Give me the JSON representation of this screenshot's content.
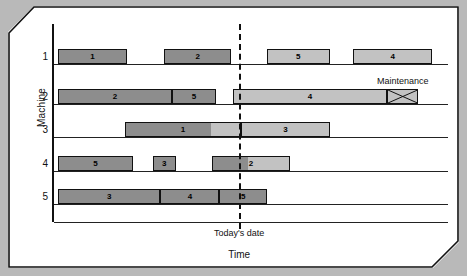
{
  "figure": {
    "background_color": "#b9b9b9",
    "sheet_color": "#ffffff"
  },
  "chart_data": {
    "type": "bar",
    "subtype": "gantt",
    "title": "",
    "xlabel": "Time",
    "ylabel": "Machine",
    "categories": [
      "1",
      "2",
      "3",
      "4",
      "5"
    ],
    "grid": false,
    "legend": "none",
    "colors": {
      "completed": "#8d8d8d",
      "remaining": "#c2c2c2",
      "outline": "#111111",
      "today_line": "#111111"
    },
    "annotations": [
      {
        "name": "today-line",
        "label": "Today's date",
        "x": 0.47
      },
      {
        "name": "maintenance-block",
        "label": "Maintenance",
        "machine": "2",
        "start": 0.845,
        "end": 0.925
      }
    ],
    "xlim": [
      0,
      1
    ],
    "axis_origin_x": 0.0,
    "series": [
      {
        "name": "Machine 1",
        "machine": "1",
        "tasks": [
          {
            "job": "1",
            "start": 0.01,
            "end": 0.185,
            "state": "completed"
          },
          {
            "job": "2",
            "start": 0.28,
            "end": 0.45,
            "state": "completed"
          },
          {
            "job": "5",
            "start": 0.54,
            "end": 0.7,
            "state": "remaining"
          },
          {
            "job": "4",
            "start": 0.76,
            "end": 0.96,
            "state": "remaining"
          }
        ]
      },
      {
        "name": "Machine 2",
        "machine": "2",
        "tasks": [
          {
            "job": "2",
            "start": 0.01,
            "end": 0.3,
            "state": "completed"
          },
          {
            "job": "5",
            "start": 0.3,
            "end": 0.41,
            "state": "completed"
          },
          {
            "job": "4",
            "start": 0.455,
            "end": 0.845,
            "state": "remaining"
          },
          {
            "job": "",
            "start": 0.845,
            "end": 0.925,
            "state": "maintenance"
          }
        ]
      },
      {
        "name": "Machine 3",
        "machine": "3",
        "tasks": [
          {
            "job": "1",
            "start": 0.18,
            "end": 0.475,
            "state": "in-progress",
            "progress": 0.73
          },
          {
            "job": "3",
            "start": 0.475,
            "end": 0.7,
            "state": "remaining"
          }
        ]
      },
      {
        "name": "Machine 4",
        "machine": "4",
        "tasks": [
          {
            "job": "5",
            "start": 0.01,
            "end": 0.2,
            "state": "completed"
          },
          {
            "job": "3",
            "start": 0.25,
            "end": 0.31,
            "state": "completed"
          },
          {
            "job": "2",
            "start": 0.4,
            "end": 0.6,
            "state": "in-progress",
            "progress": 0.45
          }
        ]
      },
      {
        "name": "Machine 5",
        "machine": "5",
        "tasks": [
          {
            "job": "3",
            "start": 0.01,
            "end": 0.27,
            "state": "completed"
          },
          {
            "job": "4",
            "start": 0.27,
            "end": 0.42,
            "state": "completed"
          },
          {
            "job": "5",
            "start": 0.42,
            "end": 0.54,
            "state": "completed"
          }
        ]
      }
    ]
  },
  "labels": {
    "y_axis_title": "Machine",
    "x_axis_title": "Time",
    "today_label": "Today's date",
    "maintenance_label": "Maintenance",
    "machines": [
      "1",
      "2",
      "3",
      "4",
      "5"
    ]
  }
}
